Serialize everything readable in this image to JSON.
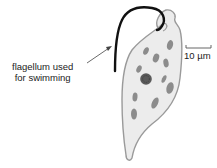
{
  "diagram": {
    "labels": {
      "flagellum_line1": "flagellum used",
      "flagellum_line2": "for swimming"
    },
    "scale_bar": {
      "label": "10 µm"
    },
    "colors": {
      "cell_fill": "#ececec",
      "cell_outline": "#9a9a9a",
      "organelle": "#8c8c8c",
      "nucleus": "#555555",
      "flagellum": "#111111"
    }
  }
}
